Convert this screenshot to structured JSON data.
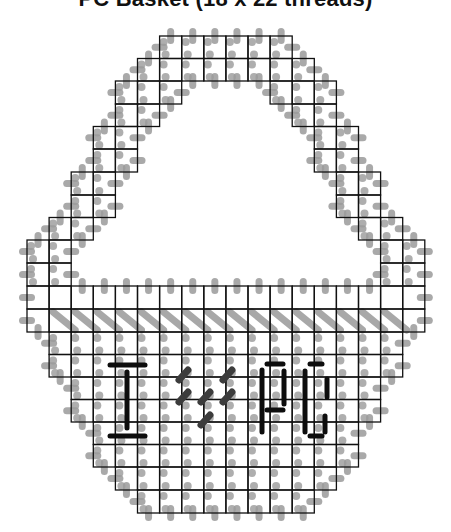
{
  "title": "PC Basket (18 x 22 threads)",
  "colors": {
    "grid": "#111111",
    "stitch_gray": "#9a9a9a",
    "letter_dark": "#0d0d0d",
    "heart_dark": "#3c3c3c"
  },
  "grid": {
    "origin_x": 27,
    "origin_y": 36,
    "cell_w": 22.1,
    "row_lines": [
      36,
      58.5,
      81,
      104,
      126.5,
      149,
      172,
      195,
      217.5,
      240,
      263,
      286,
      309,
      332,
      354.5,
      377,
      399.5,
      422,
      444.5,
      467,
      490,
      513
    ],
    "rows": [
      [
        [
          6,
          11
        ]
      ],
      [
        [
          5,
          12
        ]
      ],
      [
        [
          4,
          6
        ],
        [
          11,
          13
        ]
      ],
      [
        [
          4,
          5
        ],
        [
          12,
          13
        ]
      ],
      [
        [
          3,
          4
        ],
        [
          13,
          14
        ]
      ],
      [
        [
          3,
          4
        ],
        [
          13,
          14
        ]
      ],
      [
        [
          2,
          3
        ],
        [
          14,
          15
        ]
      ],
      [
        [
          2,
          3
        ],
        [
          14,
          15
        ]
      ],
      [
        [
          1,
          2
        ],
        [
          15,
          16
        ]
      ],
      [
        [
          0,
          1
        ],
        [
          16,
          17
        ]
      ],
      [
        [
          0,
          1
        ],
        [
          16,
          17
        ]
      ],
      [
        [
          0,
          17
        ]
      ],
      [
        [
          0,
          17
        ]
      ],
      [
        [
          1,
          16
        ]
      ],
      [
        [
          1,
          16
        ]
      ],
      [
        [
          2,
          15
        ]
      ],
      [
        [
          2,
          15
        ]
      ],
      [
        [
          3,
          14
        ]
      ],
      [
        [
          3,
          14
        ]
      ],
      [
        [
          4,
          13
        ]
      ],
      [
        [
          5,
          12
        ]
      ]
    ]
  },
  "diagonal_row": {
    "row": 12,
    "cols": [
      1,
      16
    ]
  },
  "letters": {
    "I": [
      [
        110,
        365,
        145,
        365
      ],
      [
        127,
        372,
        127,
        428
      ],
      [
        110,
        436,
        145,
        436
      ]
    ],
    "heart": [
      [
        179,
        380,
        188,
        370
      ],
      [
        223,
        380,
        232,
        370
      ],
      [
        179,
        402,
        188,
        392
      ],
      [
        201,
        402,
        210,
        392
      ],
      [
        223,
        402,
        232,
        392
      ],
      [
        201,
        425,
        210,
        415
      ]
    ],
    "P": [
      [
        262,
        370,
        262,
        432
      ],
      [
        267,
        364,
        283,
        364
      ],
      [
        284,
        371,
        284,
        404
      ],
      [
        267,
        410,
        283,
        410
      ]
    ],
    "C": [
      [
        305,
        371,
        305,
        432
      ],
      [
        310,
        364,
        322,
        364
      ],
      [
        327,
        379,
        327,
        397
      ],
      [
        325,
        416,
        325,
        432
      ],
      [
        310,
        436,
        322,
        436
      ]
    ]
  }
}
